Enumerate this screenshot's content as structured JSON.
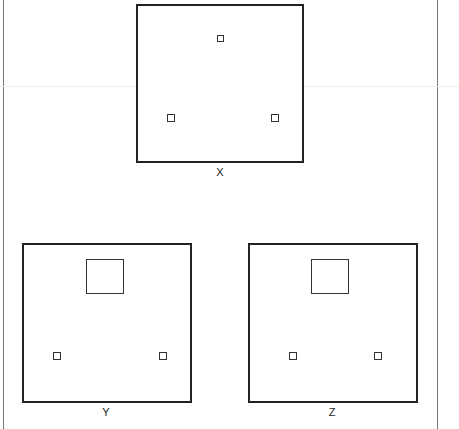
{
  "figure": {
    "panels": [
      {
        "id": "X",
        "label": "X",
        "box": {
          "x": 136,
          "y": 4,
          "w": 168,
          "h": 159
        },
        "large_squares": [],
        "small_squares": [
          {
            "x": 217,
            "y": 35,
            "s": 7
          },
          {
            "x": 167,
            "y": 114,
            "s": 8
          },
          {
            "x": 271,
            "y": 114,
            "s": 8
          }
        ],
        "label_pos": {
          "x": 220,
          "y": 166
        }
      },
      {
        "id": "Y",
        "label": "Y",
        "box": {
          "x": 22,
          "y": 243,
          "w": 170,
          "h": 160
        },
        "large_squares": [
          {
            "x": 86,
            "y": 259,
            "w": 38,
            "h": 35
          }
        ],
        "small_squares": [
          {
            "x": 53,
            "y": 352,
            "s": 8
          },
          {
            "x": 159,
            "y": 352,
            "s": 8
          }
        ],
        "label_pos": {
          "x": 106,
          "y": 406
        }
      },
      {
        "id": "Z",
        "label": "Z",
        "box": {
          "x": 248,
          "y": 243,
          "w": 170,
          "h": 160
        },
        "large_squares": [
          {
            "x": 311,
            "y": 259,
            "w": 38,
            "h": 35
          }
        ],
        "small_squares": [
          {
            "x": 289,
            "y": 352,
            "s": 8
          },
          {
            "x": 374,
            "y": 352,
            "s": 8
          }
        ],
        "label_pos": {
          "x": 332,
          "y": 406
        }
      }
    ],
    "border_lines": {
      "left_x": 3,
      "right_x": 437
    },
    "colors": {
      "stroke": "#222222",
      "border": "#777777",
      "background": "#ffffff"
    }
  }
}
